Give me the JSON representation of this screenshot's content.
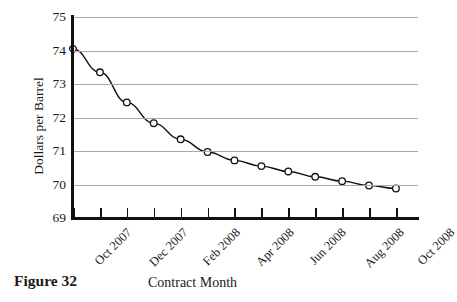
{
  "figure": {
    "caption": "Figure 32"
  },
  "chart_data": {
    "type": "line",
    "title": "",
    "xlabel": "Contract Month",
    "ylabel": "Dollars per Barrel",
    "ylim": [
      69,
      75
    ],
    "yticks": [
      69,
      70,
      71,
      72,
      73,
      74,
      75
    ],
    "ytick_labels": [
      "69",
      "70",
      "71",
      "72",
      "73",
      "74",
      "75"
    ],
    "grid": true,
    "grid_axis": "y",
    "legend": "none",
    "marker": "open-circle",
    "line_color": "#111111",
    "grid_color": "#a9a9a9",
    "x": [
      "Oct 2007",
      "Nov 2007",
      "Dec 2007",
      "Jan 2008",
      "Feb 2008",
      "Mar 2008",
      "Apr 2008",
      "May 2008",
      "Jun 2008",
      "Jul 2008",
      "Aug 2008",
      "Sep 2008",
      "Oct 2008"
    ],
    "xtick_labels_shown": [
      "Oct 2007",
      "Dec 2007",
      "Feb 2008",
      "Apr 2008",
      "Jun 2008",
      "Aug 2008",
      "Oct 2008"
    ],
    "values": [
      74.05,
      73.35,
      72.45,
      71.83,
      71.35,
      70.97,
      70.72,
      70.55,
      70.39,
      70.23,
      70.1,
      69.97,
      69.88
    ],
    "categories": [
      "Oct 2007",
      "Nov 2007",
      "Dec 2007",
      "Jan 2008",
      "Feb 2008",
      "Mar 2008",
      "Apr 2008",
      "May 2008",
      "Jun 2008",
      "Jul 2008",
      "Aug 2008",
      "Sep 2008",
      "Oct 2008"
    ]
  }
}
